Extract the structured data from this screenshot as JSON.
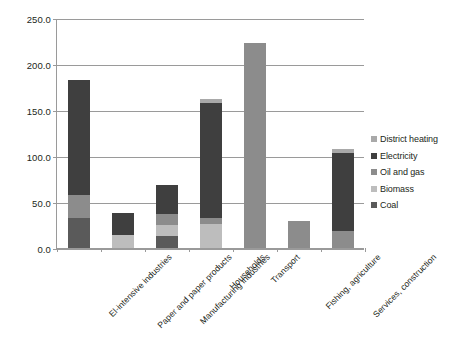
{
  "chart_data": {
    "type": "bar",
    "subtype": "stacked-bar",
    "title": "",
    "xlabel": "",
    "ylabel": "",
    "ylim": [
      0,
      250
    ],
    "ytick_step": 50,
    "ytick_labels": [
      "0.0",
      "50.0",
      "100.0",
      "150.0",
      "200.0",
      "250.0"
    ],
    "ytick_values": [
      0,
      50,
      100,
      150,
      200,
      250
    ],
    "grid": true,
    "legend_position": "right",
    "categories": [
      "El-intensive industries",
      "Paper and paper products",
      "Manufacturing industries",
      "Households",
      "Transport",
      "Fishing, agriculture",
      "Services, construction"
    ],
    "series": [
      {
        "name": "Coal",
        "color": "#5a5a5a",
        "values": [
          33,
          0,
          13,
          0,
          0,
          0,
          0
        ]
      },
      {
        "name": "Biomass",
        "color": "#bdbdbd",
        "values": [
          0,
          14,
          12,
          26,
          0,
          0,
          0
        ]
      },
      {
        "name": "Oil and gas",
        "color": "#8c8c8c",
        "values": [
          25,
          0,
          12,
          7,
          223,
          29,
          18
        ]
      },
      {
        "name": "Electricity",
        "color": "#3f3f3f",
        "values": [
          125,
          24,
          31,
          125,
          0,
          0,
          85
        ]
      },
      {
        "name": "District heating",
        "color": "#a9a9a9",
        "values": [
          0,
          0,
          0,
          4,
          0,
          0,
          5
        ]
      }
    ],
    "totals": [
      183,
      38,
      68,
      162,
      223,
      29,
      108
    ],
    "legend_entries": [
      {
        "label": "District heating",
        "color": "#a9a9a9"
      },
      {
        "label": "Electricity",
        "color": "#3f3f3f"
      },
      {
        "label": "Oil and gas",
        "color": "#8c8c8c"
      },
      {
        "label": "Biomass",
        "color": "#bdbdbd"
      },
      {
        "label": "Coal",
        "color": "#5a5a5a"
      }
    ],
    "axis_color": "#9a9a9a",
    "background_color": "#ffffff"
  }
}
